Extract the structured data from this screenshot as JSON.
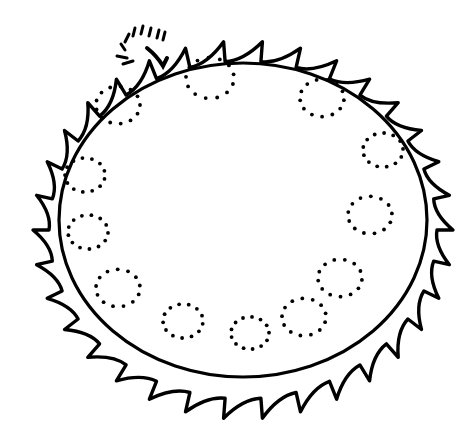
{
  "drawing": {
    "subject": "orange fruit tracing worksheet",
    "stroke_color": "#000000",
    "background_color": "#ffffff",
    "fruit": {
      "center": [
        243,
        220
      ],
      "rx": 184,
      "ry": 157
    },
    "stem": {
      "x": 163,
      "y": 66
    },
    "dotted_circles": [
      {
        "cx": 118,
        "cy": 105,
        "r": 22
      },
      {
        "cx": 210,
        "cy": 78,
        "r": 24
      },
      {
        "cx": 322,
        "cy": 98,
        "r": 22
      },
      {
        "cx": 383,
        "cy": 150,
        "r": 20
      },
      {
        "cx": 85,
        "cy": 175,
        "r": 20
      },
      {
        "cx": 88,
        "cy": 232,
        "r": 20
      },
      {
        "cx": 118,
        "cy": 288,
        "r": 22
      },
      {
        "cx": 183,
        "cy": 321,
        "r": 20
      },
      {
        "cx": 250,
        "cy": 333,
        "r": 19
      },
      {
        "cx": 304,
        "cy": 317,
        "r": 22
      },
      {
        "cx": 340,
        "cy": 278,
        "r": 22
      },
      {
        "cx": 370,
        "cy": 215,
        "r": 22
      }
    ]
  }
}
